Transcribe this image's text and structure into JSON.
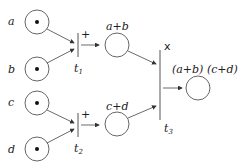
{
  "places": [
    {
      "id": "a",
      "label": "a",
      "token": true
    },
    {
      "id": "b",
      "label": "b",
      "token": true
    },
    {
      "id": "c",
      "label": "c",
      "token": true
    },
    {
      "id": "d",
      "label": "d",
      "token": true
    },
    {
      "id": "ab",
      "label": "a+b",
      "token": false
    },
    {
      "id": "cd",
      "label": "c+d",
      "token": false
    },
    {
      "id": "out",
      "label": "(a+b) (c+d)",
      "token": false
    }
  ],
  "transitions": [
    {
      "id": "t1",
      "label": "t",
      "sub": "1",
      "op": "+"
    },
    {
      "id": "t2",
      "label": "t",
      "sub": "2",
      "op": "+"
    },
    {
      "id": "t3",
      "label": "t",
      "sub": "3",
      "op": "x"
    }
  ]
}
